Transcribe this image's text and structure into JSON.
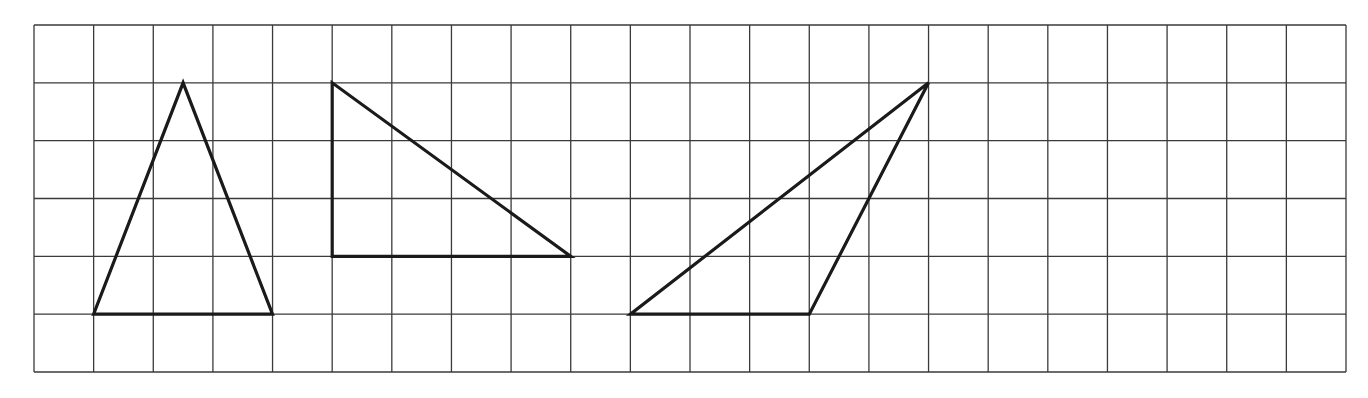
{
  "grid": {
    "left": 34,
    "top": 25,
    "right": 1346,
    "bottom": 372,
    "columns": 22,
    "rows": 6,
    "line_color": "#3a3a3a",
    "line_width": 1.3
  },
  "shape_style": {
    "stroke": "#1a1a1a",
    "stroke_width": 3.2
  },
  "triangles": [
    {
      "name": "isosceles-triangle",
      "vertices": [
        [
          1,
          5
        ],
        [
          4,
          5
        ],
        [
          2.5,
          1
        ]
      ]
    },
    {
      "name": "right-triangle",
      "vertices": [
        [
          5,
          1
        ],
        [
          5,
          4
        ],
        [
          9,
          4
        ]
      ]
    },
    {
      "name": "obtuse-triangle",
      "vertices": [
        [
          10,
          5
        ],
        [
          13,
          5
        ],
        [
          15,
          1
        ]
      ]
    }
  ]
}
